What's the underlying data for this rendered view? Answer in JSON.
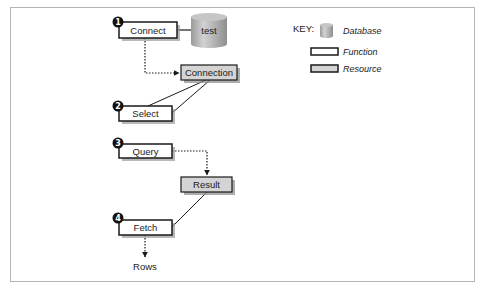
{
  "diagram": {
    "type": "flow",
    "nodes": {
      "connect": {
        "label": "Connect",
        "kind": "function",
        "step": "1"
      },
      "database": {
        "label": "test",
        "kind": "database"
      },
      "connection": {
        "label": "Connection",
        "kind": "resource"
      },
      "select": {
        "label": "Select",
        "kind": "function",
        "step": "2"
      },
      "query": {
        "label": "Query",
        "kind": "function",
        "step": "3"
      },
      "result": {
        "label": "Result",
        "kind": "resource"
      },
      "fetch": {
        "label": "Fetch",
        "kind": "function",
        "step": "4"
      },
      "rows": {
        "label": "Rows",
        "kind": "output"
      }
    },
    "edges": [
      {
        "from": "connect",
        "to": "database",
        "style": "solid"
      },
      {
        "from": "connect",
        "to": "connection",
        "style": "dotted-arrow"
      },
      {
        "from": "select",
        "to": "connection",
        "style": "solid"
      },
      {
        "from": "query",
        "to": "result",
        "style": "dotted-arrow"
      },
      {
        "from": "fetch",
        "to": "result",
        "style": "solid"
      },
      {
        "from": "fetch",
        "to": "rows",
        "style": "dotted-arrow"
      }
    ]
  },
  "key": {
    "title": "KEY:",
    "items": [
      {
        "label": "Database",
        "shape": "cylinder"
      },
      {
        "label": "Function",
        "shape": "white-box"
      },
      {
        "label": "Resource",
        "shape": "gray-box"
      }
    ]
  },
  "colors": {
    "function_fill": "#ffffff",
    "resource_fill": "#d4d4d4",
    "database_fill": "#b8b8b8",
    "shadow": "#8a8a8a",
    "stroke": "#1a1a1a",
    "badge": "#111111"
  }
}
